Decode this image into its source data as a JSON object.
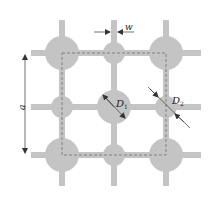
{
  "diagram": {
    "title": "",
    "colors": {
      "background": "#ffffff",
      "fill": "#c4c4c4",
      "dashed": "#6f6f6f",
      "arrow": "#333333",
      "text": "#222222"
    },
    "labels": {
      "a": "a",
      "w": "w",
      "d1_main": "D",
      "d1_sub": "1",
      "d2_main": "D",
      "d2_sub": "2"
    },
    "grid": {
      "rows_y": [
        53,
        107,
        155
      ],
      "cols_x": [
        62,
        114,
        166
      ],
      "line_width": 6
    },
    "nodes": [
      {
        "id": "top-left",
        "type": "large"
      },
      {
        "id": "top-middle",
        "type": "small"
      },
      {
        "id": "top-right",
        "type": "large"
      },
      {
        "id": "middle-left",
        "type": "small"
      },
      {
        "id": "center",
        "type": "large"
      },
      {
        "id": "middle-right",
        "type": "small"
      },
      {
        "id": "bottom-left",
        "type": "large"
      },
      {
        "id": "bottom-middle",
        "type": "small"
      },
      {
        "id": "bottom-right",
        "type": "large"
      }
    ],
    "dimensions": [
      {
        "name": "a",
        "meaning": "lattice period"
      },
      {
        "name": "w",
        "meaning": "strip width"
      },
      {
        "name": "D1",
        "meaning": "large circle diameter"
      },
      {
        "name": "D2",
        "meaning": "small circle diameter"
      }
    ]
  }
}
